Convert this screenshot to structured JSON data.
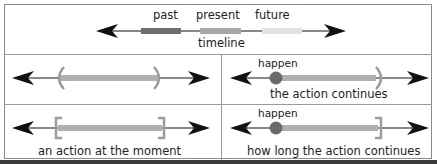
{
  "timeline": {
    "labels": {
      "past": "past",
      "present": "present",
      "future": "future"
    },
    "caption": "timeline",
    "segment_colors": {
      "past": "#6e6e6e",
      "present": "#a8a8a8",
      "future": "#e2e2e2"
    }
  },
  "panels": [
    {
      "id": "continuous-range",
      "caption": "",
      "marker": "round-brackets"
    },
    {
      "id": "action-continues",
      "caption": "the action continues",
      "point_label": "happen",
      "marker": "dot-to-round-bracket"
    },
    {
      "id": "action-at-moment",
      "caption": "an action at the moment",
      "marker": "square-brackets"
    },
    {
      "id": "how-long-continues",
      "caption": "how long the action continues",
      "point_label": "happen",
      "marker": "dot-to-square-bracket"
    }
  ],
  "colors": {
    "arrow": "#111111",
    "bar": "#b0b0b0",
    "bracket": "#9c9c9c",
    "dot": "#6a6a6a",
    "border": "#8a8a8a"
  }
}
